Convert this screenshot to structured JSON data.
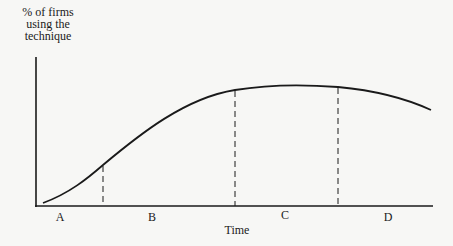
{
  "diagram": {
    "type": "diffusion-curve",
    "y_axis_label": [
      "% of firms",
      "using the",
      "technique"
    ],
    "x_axis_label": "Time",
    "phases": [
      {
        "label": "A",
        "x": 60
      },
      {
        "label": "B",
        "x": 152
      },
      {
        "label": "C",
        "x": 285
      },
      {
        "label": "D",
        "x": 387
      }
    ],
    "boundaries_x": [
      103,
      235,
      338
    ],
    "curve_color": "#1a1a1a"
  }
}
